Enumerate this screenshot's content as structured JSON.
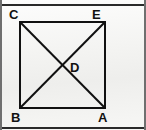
{
  "figure": {
    "background_color": "#f2f2f0",
    "stroke_color": "#111111",
    "label_color": "#111111",
    "square": {
      "top_left": [
        20,
        22
      ],
      "top_right": [
        105,
        22
      ],
      "bottom_right": [
        105,
        108
      ],
      "bottom_left": [
        20,
        108
      ],
      "stroke_width": 2
    },
    "diagonals": [
      {
        "name": "diagonal-C-A",
        "from": [
          20,
          22
        ],
        "to": [
          105,
          108
        ]
      },
      {
        "name": "diagonal-B-E",
        "from": [
          20,
          108
        ],
        "to": [
          105,
          22
        ]
      }
    ],
    "intersection": [
      62,
      65
    ],
    "labels": {
      "top_left": "C",
      "top_right": "E",
      "bottom_left": "B",
      "bottom_right": "A",
      "center": "D"
    }
  }
}
